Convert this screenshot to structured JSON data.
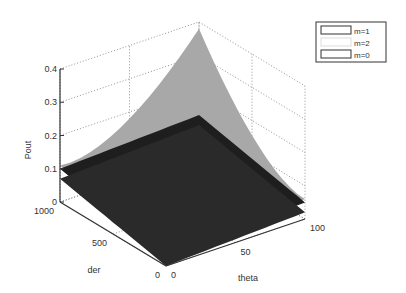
{
  "chart_data": {
    "type": "surface3d",
    "title": "",
    "xlabel": "theta",
    "ylabel": "der",
    "zlabel": "Pout",
    "xlim": [
      0,
      100
    ],
    "ylim": [
      0,
      1000
    ],
    "zlim": [
      0,
      0.4
    ],
    "xticks": [
      "0",
      "50",
      "100"
    ],
    "yticks": [
      "0",
      "500",
      "1000"
    ],
    "zticks": [
      "0",
      "0.1",
      "0.2",
      "0.3",
      "0.4"
    ],
    "grid": true,
    "legend": {
      "position": "top-right",
      "entries": [
        "m=1",
        "m=2",
        "m=0"
      ]
    },
    "series": [
      {
        "name": "m=1",
        "color": "#a8a8a8",
        "description": "curved surface rising to a peak near theta=100, der=1000",
        "corners": [
          {
            "theta": 0,
            "der": 0,
            "pout": 0.0
          },
          {
            "theta": 100,
            "der": 0,
            "pout": 0.06
          },
          {
            "theta": 0,
            "der": 1000,
            "pout": 0.11
          },
          {
            "theta": 100,
            "der": 1000,
            "pout": 0.38
          }
        ]
      },
      {
        "name": "m=2",
        "color": "#1e1e1e",
        "description": "nearly flat plane",
        "corners": [
          {
            "theta": 0,
            "der": 0,
            "pout": 0.03
          },
          {
            "theta": 100,
            "der": 0,
            "pout": 0.05
          },
          {
            "theta": 0,
            "der": 1000,
            "pout": 0.1
          },
          {
            "theta": 100,
            "der": 1000,
            "pout": 0.12
          }
        ]
      },
      {
        "name": "m=0",
        "color": "#2a2a2a",
        "description": "nearly flat plane slightly below m=2",
        "corners": [
          {
            "theta": 0,
            "der": 0,
            "pout": 0.0
          },
          {
            "theta": 100,
            "der": 0,
            "pout": 0.02
          },
          {
            "theta": 0,
            "der": 1000,
            "pout": 0.07
          },
          {
            "theta": 100,
            "der": 1000,
            "pout": 0.09
          }
        ]
      }
    ]
  }
}
